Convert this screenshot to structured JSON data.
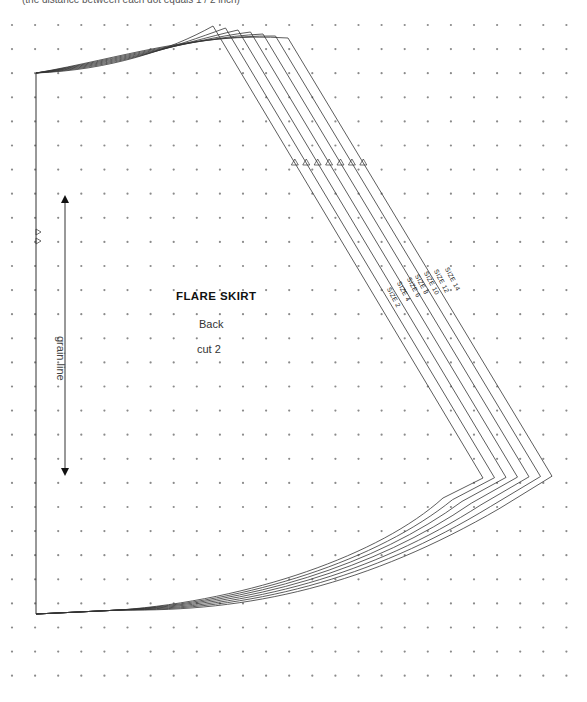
{
  "caption": "(the distance between each dot equals 1 / 2 inch)",
  "pattern": {
    "title": "FLARE SKIRT",
    "piece": "Back",
    "cut": "cut 2",
    "grain_label": "grain line"
  },
  "sizes": [
    {
      "label": "SIZE 2"
    },
    {
      "label": "SIZE 4"
    },
    {
      "label": "SIZE 6"
    },
    {
      "label": "SIZE 8"
    },
    {
      "label": "SIZE 10"
    },
    {
      "label": "SIZE 12"
    },
    {
      "label": "SIZE 14"
    }
  ],
  "colors": {
    "line": "#333333",
    "dot": "#888888",
    "background": "#ffffff"
  }
}
